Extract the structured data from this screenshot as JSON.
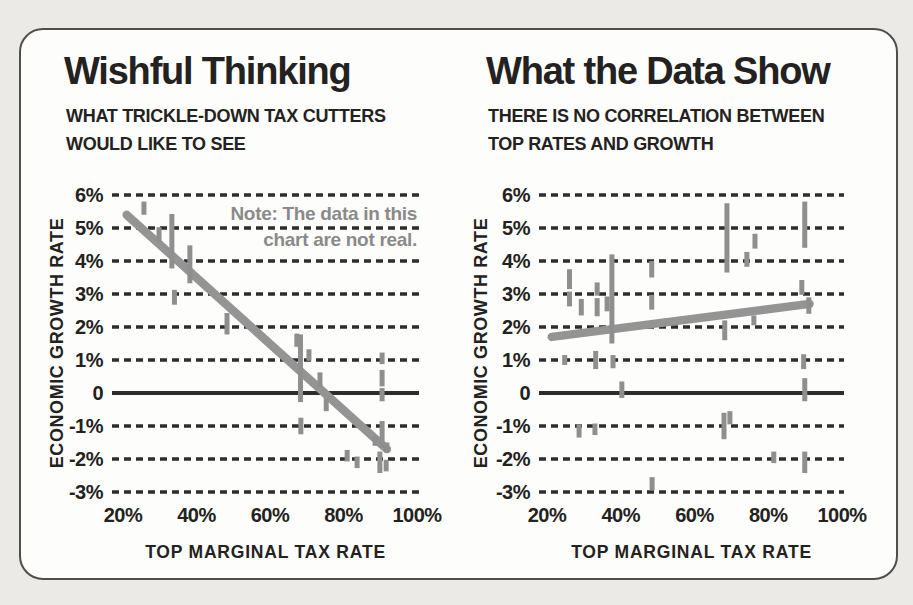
{
  "page": {
    "background": "#eceae6"
  },
  "panel": {
    "background": "#fdfdfb",
    "border_color": "#4e4e4a"
  },
  "colors": {
    "ink": "#232220",
    "grid": "#2e2d2a",
    "trend": "#949494",
    "point": "#8f8f8f",
    "note": "#8a8a8a"
  },
  "chart_data": [
    {
      "type": "scatter",
      "title": "Wishful Thinking",
      "subtitle_lines": [
        "WHAT TRICKLE-DOWN TAX CUTTERS",
        "WOULD LIKE TO SEE"
      ],
      "note_lines": [
        "Note: The data in this",
        "chart are not real."
      ],
      "xlabel": "TOP MARGINAL TAX RATE",
      "ylabel": "ECONOMIC GROWTH RATE",
      "xlim": [
        20,
        100
      ],
      "ylim": [
        -3,
        6
      ],
      "grid": "dashed-horizontal, zero-line solid",
      "legend": "none",
      "x_ticks": [
        {
          "v": 20,
          "label": "20%"
        },
        {
          "v": 40,
          "label": "40%"
        },
        {
          "v": 60,
          "label": "60%"
        },
        {
          "v": 80,
          "label": "80%"
        },
        {
          "v": 100,
          "label": "100%"
        }
      ],
      "y_ticks": [
        {
          "v": 6,
          "label": "6%"
        },
        {
          "v": 5,
          "label": "5%"
        },
        {
          "v": 4,
          "label": "4%"
        },
        {
          "v": 3,
          "label": "3%"
        },
        {
          "v": 2,
          "label": "2%"
        },
        {
          "v": 1,
          "label": "1%"
        },
        {
          "v": 0,
          "label": "0"
        },
        {
          "v": -1,
          "label": "-1%"
        },
        {
          "v": -2,
          "label": "-2%"
        },
        {
          "v": -3,
          "label": "-3%"
        }
      ],
      "trend": {
        "x1": 21,
        "y1": 5.4,
        "x2": 91.8,
        "y2": -1.7
      },
      "points": [
        {
          "x": 25.7,
          "y": 5.6,
          "l": 0.4
        },
        {
          "x": 29.8,
          "y": 4.8,
          "l": 0.45
        },
        {
          "x": 33.3,
          "y": 4.6,
          "l": 1.65
        },
        {
          "x": 38.2,
          "y": 3.9,
          "l": 1.15
        },
        {
          "x": 34.0,
          "y": 2.9,
          "l": 0.45
        },
        {
          "x": 48.3,
          "y": 2.1,
          "l": 0.65
        },
        {
          "x": 67.3,
          "y": 1.6,
          "l": 0.4
        },
        {
          "x": 68.3,
          "y": 0.75,
          "l": 2.05
        },
        {
          "x": 70.6,
          "y": 1.15,
          "l": 0.35
        },
        {
          "x": 73.6,
          "y": 0.4,
          "l": 0.45
        },
        {
          "x": 75.3,
          "y": -0.35,
          "l": 0.4
        },
        {
          "x": 68.4,
          "y": -1.0,
          "l": 0.5
        },
        {
          "x": 81.0,
          "y": -1.9,
          "l": 0.35
        },
        {
          "x": 83.7,
          "y": -2.1,
          "l": 0.35
        },
        {
          "x": 90.5,
          "y": 1.05,
          "l": 0.35
        },
        {
          "x": 90.5,
          "y": 0.45,
          "l": 0.5
        },
        {
          "x": 90.5,
          "y": -0.05,
          "l": 0.4
        },
        {
          "x": 90.5,
          "y": -1.25,
          "l": 0.8
        },
        {
          "x": 88.6,
          "y": -1.45,
          "l": 0.3
        },
        {
          "x": 89.9,
          "y": -2.1,
          "l": 0.65
        },
        {
          "x": 91.8,
          "y": -1.65,
          "l": 0.3
        },
        {
          "x": 91.6,
          "y": -2.2,
          "l": 0.35
        }
      ]
    },
    {
      "type": "scatter",
      "title": "What the Data Show",
      "subtitle_lines": [
        "THERE IS NO CORRELATION BETWEEN",
        "TOP RATES AND GROWTH"
      ],
      "note_lines": [],
      "xlabel": "TOP MARGINAL TAX RATE",
      "ylabel": "ECONOMIC GROWTH RATE",
      "xlim": [
        20,
        100
      ],
      "ylim": [
        -3,
        6
      ],
      "grid": "dashed-horizontal, zero-line solid",
      "legend": "none",
      "x_ticks": [
        {
          "v": 20,
          "label": "20%"
        },
        {
          "v": 40,
          "label": "40%"
        },
        {
          "v": 60,
          "label": "60%"
        },
        {
          "v": 80,
          "label": "80%"
        },
        {
          "v": 100,
          "label": "100%"
        }
      ],
      "y_ticks": [
        {
          "v": 6,
          "label": "6%"
        },
        {
          "v": 5,
          "label": "5%"
        },
        {
          "v": 4,
          "label": "4%"
        },
        {
          "v": 3,
          "label": "3%"
        },
        {
          "v": 2,
          "label": "2%"
        },
        {
          "v": 1,
          "label": "1%"
        },
        {
          "v": 0,
          "label": "0"
        },
        {
          "v": -1,
          "label": "-1%"
        },
        {
          "v": -2,
          "label": "-2%"
        },
        {
          "v": -3,
          "label": "-3%"
        }
      ],
      "trend": {
        "x1": 21.3,
        "y1": 1.7,
        "x2": 91.2,
        "y2": 2.7
      },
      "points": [
        {
          "x": 26.1,
          "y": 3.45,
          "l": 0.6
        },
        {
          "x": 26.1,
          "y": 2.85,
          "l": 0.45
        },
        {
          "x": 29.3,
          "y": 2.6,
          "l": 0.5
        },
        {
          "x": 33.6,
          "y": 3.15,
          "l": 0.4
        },
        {
          "x": 33.6,
          "y": 2.6,
          "l": 0.55
        },
        {
          "x": 36.3,
          "y": 2.7,
          "l": 0.45
        },
        {
          "x": 37.6,
          "y": 2.85,
          "l": 2.7
        },
        {
          "x": 24.8,
          "y": 1.0,
          "l": 0.3
        },
        {
          "x": 33.2,
          "y": 1.0,
          "l": 0.55
        },
        {
          "x": 37.9,
          "y": 0.95,
          "l": 0.4
        },
        {
          "x": 48.4,
          "y": 3.75,
          "l": 0.5
        },
        {
          "x": 48.4,
          "y": 2.75,
          "l": 0.45
        },
        {
          "x": 68.8,
          "y": 4.7,
          "l": 2.1
        },
        {
          "x": 68.2,
          "y": 1.9,
          "l": 0.6
        },
        {
          "x": 74.2,
          "y": 4.05,
          "l": 0.45
        },
        {
          "x": 76.4,
          "y": 4.6,
          "l": 0.45
        },
        {
          "x": 76.1,
          "y": 2.2,
          "l": 0.3
        },
        {
          "x": 89.9,
          "y": 5.1,
          "l": 1.4
        },
        {
          "x": 89.1,
          "y": 3.2,
          "l": 0.45
        },
        {
          "x": 91.0,
          "y": 2.65,
          "l": 0.5
        },
        {
          "x": 89.6,
          "y": 0.95,
          "l": 0.45
        },
        {
          "x": 89.9,
          "y": 0.1,
          "l": 0.7
        },
        {
          "x": 40.3,
          "y": 0.1,
          "l": 0.5
        },
        {
          "x": 28.7,
          "y": -1.15,
          "l": 0.4
        },
        {
          "x": 33.0,
          "y": -1.1,
          "l": 0.35
        },
        {
          "x": 48.5,
          "y": -2.75,
          "l": 0.4
        },
        {
          "x": 68.0,
          "y": -1.0,
          "l": 0.8
        },
        {
          "x": 69.6,
          "y": -0.75,
          "l": 0.4
        },
        {
          "x": 81.5,
          "y": -1.95,
          "l": 0.35
        },
        {
          "x": 89.9,
          "y": -2.1,
          "l": 0.65
        }
      ]
    }
  ]
}
